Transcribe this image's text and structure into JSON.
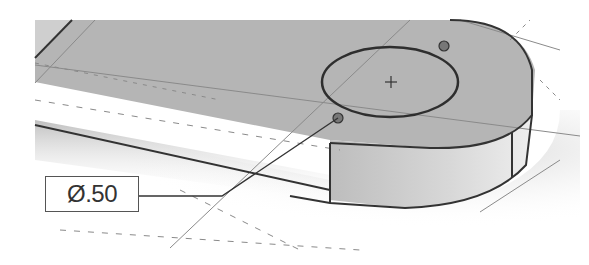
{
  "diagram": {
    "type": "cad-3d-part-view",
    "annotation": {
      "symbol": "Ø",
      "value": ".50",
      "text": "Ø.50",
      "meaning": "hole diameter dimension"
    },
    "features": [
      {
        "name": "hole",
        "center_mark": "+"
      },
      {
        "name": "rounded-end-boss"
      },
      {
        "name": "sketch-grid"
      }
    ],
    "colors": {
      "face": "#b4b4b4",
      "edge": "#333333",
      "grid": "#8a8a8a",
      "background": "#ffffff"
    }
  }
}
